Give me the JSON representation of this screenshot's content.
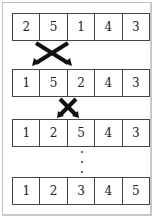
{
  "diagram": {
    "rows": [
      {
        "cells": [
          "2",
          "5",
          "1",
          "4",
          "3"
        ]
      },
      {
        "cells": [
          "1",
          "5",
          "2",
          "4",
          "3"
        ]
      },
      {
        "cells": [
          "1",
          "2",
          "5",
          "4",
          "3"
        ]
      },
      {
        "cells": [
          "1",
          "2",
          "3",
          "4",
          "5"
        ]
      }
    ],
    "swaps": [
      {
        "from_index": 0,
        "to_index": 2,
        "icon": "cross-arrows-icon"
      },
      {
        "from_index": 1,
        "to_index": 2,
        "icon": "cross-arrows-icon"
      }
    ],
    "ellipsis": "⋮"
  }
}
